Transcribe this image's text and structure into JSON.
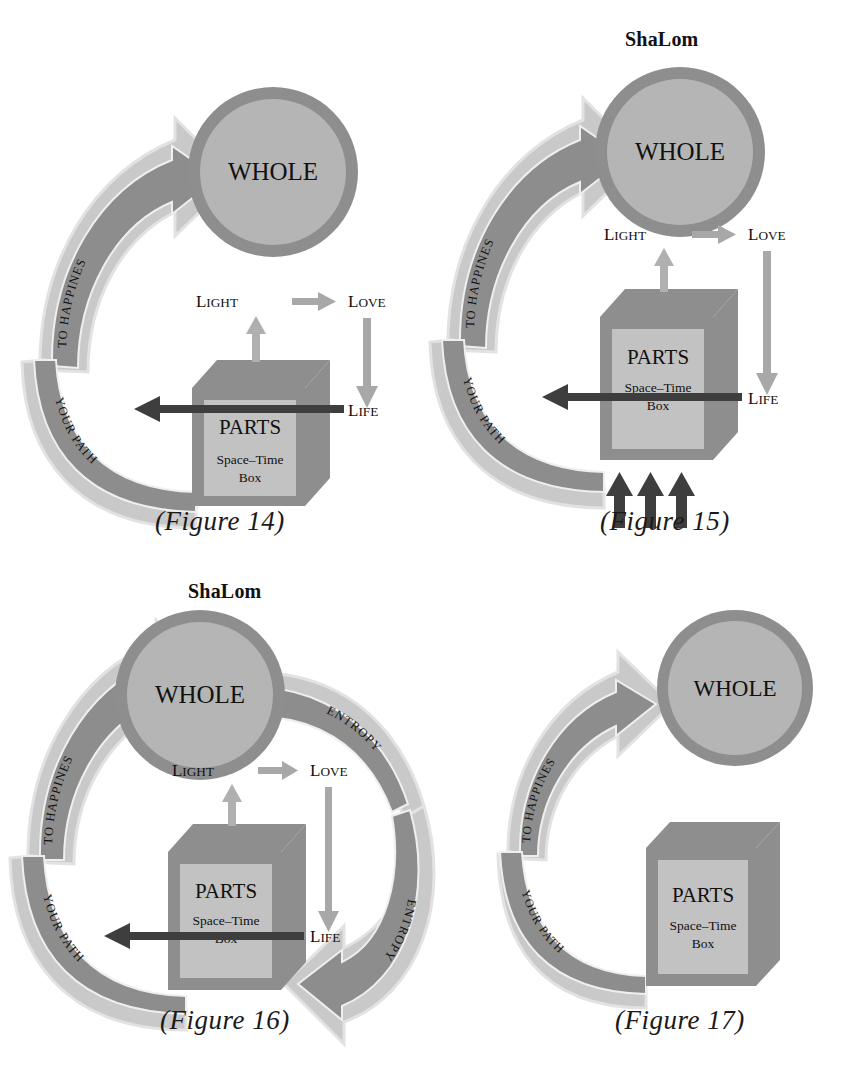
{
  "document": {
    "type": "diagram-set",
    "background": "#ffffff",
    "palette": {
      "whole_fill": "#b5b5b5",
      "whole_ring": "#8e8e8e",
      "box_top_side": "#8e8e8e",
      "box_face": "#bdbdbd",
      "arrow_band_dark": "#8a8a8a",
      "arrow_band_light": "#c9c9c9",
      "arrow_band_outline": "#d8d8d8",
      "dark_arrow": "#4a4a4a",
      "text": "#111111"
    },
    "shared_labels": {
      "whole": "WHOLE",
      "parts": "PARTS",
      "space_time_box": "Space–Time\nBox",
      "space_time_line1": "Space–Time",
      "space_time_line2": "Box",
      "to_happines": "TO HAPPINES",
      "your_path": "YOUR PATH",
      "entropy": "ENTROPY",
      "light": "LIGHT",
      "love": "LOVE",
      "life": "LIFE",
      "shalom": "ShaLom"
    }
  },
  "figures": [
    {
      "id": "fig14",
      "caption": "(Figure 14)",
      "heading": null,
      "circle_label": "WHOLE",
      "box_title": "PARTS",
      "box_sub_line1": "Space–Time",
      "box_sub_line2": "Box",
      "up_arrow_label": "TO HAPPINES",
      "down_arrow_label": "YOUR PATH",
      "triad": {
        "light": "LIGHT",
        "love": "LOVE",
        "life": "LIFE"
      },
      "has_entropy": false,
      "has_bottom_arrows": false,
      "has_triad": true
    },
    {
      "id": "fig15",
      "caption": "(Figure 15)",
      "heading": "ShaLom",
      "circle_label": "WHOLE",
      "box_title": "PARTS",
      "box_sub_line1": "Space–Time",
      "box_sub_line2": "Box",
      "up_arrow_label": "TO HAPPINES",
      "down_arrow_label": "YOUR PATH",
      "triad": {
        "light": "LIGHT",
        "love": "LOVE",
        "life": "LIFE"
      },
      "has_entropy": false,
      "has_bottom_arrows": true,
      "bottom_arrow_count": 3,
      "has_triad": true
    },
    {
      "id": "fig16",
      "caption": "(Figure 16)",
      "heading": "ShaLom",
      "circle_label": "WHOLE",
      "box_title": "PARTS",
      "box_sub_line1": "Space–Time",
      "box_sub_line2": "Box",
      "up_arrow_label": "TO HAPPINES",
      "down_arrow_label": "YOUR PATH",
      "entropy_upper_label": "ENTROPY",
      "entropy_lower_label": "ENTROPY",
      "triad": {
        "light": "LIGHT",
        "love": "LOVE",
        "life": "LIFE"
      },
      "has_entropy": true,
      "has_bottom_arrows": false,
      "has_triad": true
    },
    {
      "id": "fig17",
      "caption": "(Figure 17)",
      "heading": null,
      "circle_label": "WHOLE",
      "box_title": "PARTS",
      "box_sub_line1": "Space–Time",
      "box_sub_line2": "Box",
      "up_arrow_label": "TO HAPPINES",
      "down_arrow_label": "YOUR PATH",
      "triad": null,
      "has_entropy": false,
      "has_bottom_arrows": false,
      "has_triad": false
    }
  ]
}
